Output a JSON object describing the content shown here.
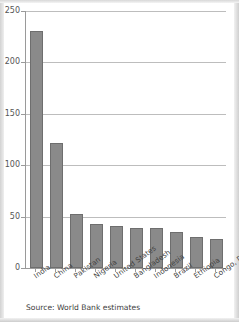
{
  "chart_data": {
    "type": "bar",
    "title": "",
    "subtitle": "",
    "xlabel": "",
    "ylabel": "",
    "categories": [
      "India",
      "China",
      "Pakistan",
      "Nigeria",
      "United States",
      "Bangladesh",
      "Indonesia",
      "Brazil",
      "Ethiopia",
      "Congo, Dem. Rep."
    ],
    "values": [
      231,
      122,
      53,
      43,
      41,
      39,
      39,
      35,
      30,
      28
    ],
    "ylim": [
      0,
      250
    ],
    "yticks": [
      0,
      50,
      100,
      150,
      200,
      250
    ],
    "ytick_labels": [
      "0",
      "50",
      "100",
      "150",
      "200",
      "250"
    ],
    "grid": "horizontal",
    "legend": "none",
    "bar_color": "#8a8a8a",
    "bar_edge_color": "#6e6e6e",
    "gridline_color": "#bdbdbd",
    "axis_color": "#9a9a9a"
  },
  "source_note": "Source: World Bank estimates"
}
